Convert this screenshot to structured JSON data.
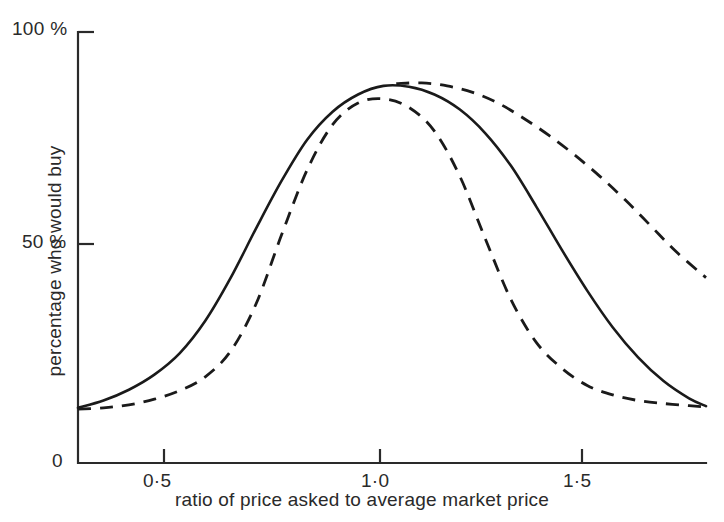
{
  "chart_data": {
    "type": "line",
    "title": "",
    "subtitle": "",
    "xlabel": "ratio of price asked to average market price",
    "ylabel": "percentage who would buy",
    "xlim": [
      0.3,
      1.78
    ],
    "ylim": [
      0,
      100
    ],
    "grid": false,
    "legend_position": "none",
    "x_ticks": [
      0.5,
      1.0,
      1.5
    ],
    "x_tick_labels": [
      "0·5",
      "1·0",
      "1·5"
    ],
    "y_ticks": [
      0,
      50,
      100
    ],
    "y_tick_labels": [
      "0",
      "50 %",
      "100 %"
    ],
    "series": [
      {
        "name": "solid curve",
        "style": "solid",
        "color": "#1a1a1a",
        "x": [
          0.3,
          0.36,
          0.42,
          0.48,
          0.54,
          0.6,
          0.66,
          0.72,
          0.78,
          0.84,
          0.9,
          0.96,
          1.02,
          1.08,
          1.14,
          1.2,
          1.26,
          1.32,
          1.38,
          1.44,
          1.5,
          1.56,
          1.62,
          1.68,
          1.74,
          1.78
        ],
        "y": [
          12.8,
          14.5,
          17.0,
          20.5,
          25.5,
          33.0,
          43.0,
          54.5,
          65.5,
          75.0,
          81.5,
          85.5,
          87.5,
          87.3,
          85.5,
          82.0,
          76.5,
          69.0,
          59.5,
          49.5,
          40.0,
          31.5,
          24.5,
          19.0,
          15.0,
          13.2
        ]
      },
      {
        "name": "dashed curve",
        "style": "dashed",
        "color": "#1a1a1a",
        "x": [
          0.3,
          0.36,
          0.42,
          0.48,
          0.54,
          0.6,
          0.66,
          0.72,
          0.78,
          0.84,
          0.9,
          0.96,
          1.02,
          1.08,
          1.14,
          1.2,
          1.26,
          1.32,
          1.38,
          1.44,
          1.5,
          1.56,
          1.62,
          1.68,
          1.74,
          1.78
        ],
        "y": [
          12.5,
          12.8,
          13.5,
          14.8,
          16.8,
          20.0,
          26.0,
          37.0,
          53.0,
          68.0,
          78.5,
          83.5,
          84.5,
          82.5,
          77.0,
          66.5,
          52.0,
          38.0,
          28.0,
          22.0,
          18.0,
          15.8,
          14.5,
          13.8,
          13.3,
          13.0
        ]
      },
      {
        "name": "dashed upper branch",
        "style": "dashed",
        "color": "#1a1a1a",
        "x": [
          1.05,
          1.11,
          1.17,
          1.23,
          1.29,
          1.35,
          1.41,
          1.47,
          1.53,
          1.59,
          1.65,
          1.71,
          1.78
        ],
        "y": [
          88.0,
          88.2,
          87.5,
          86.0,
          83.5,
          80.0,
          76.0,
          71.5,
          66.5,
          61.0,
          55.0,
          49.0,
          43.0
        ]
      }
    ],
    "annotations": []
  },
  "axis": {
    "y_top_label": "100 %",
    "y_mid_label": "50 %",
    "y_zero_label": "0",
    "x_tick_1": "0·5",
    "x_tick_2": "1·0",
    "x_tick_3": "1·5",
    "y_title": "percentage who would buy",
    "x_title": "ratio of price asked to average market price",
    "axis_color": "#2a2a2a"
  }
}
